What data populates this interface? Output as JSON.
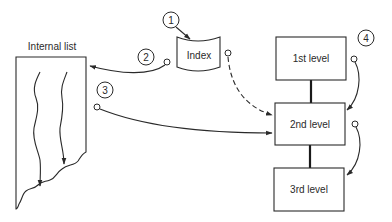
{
  "diagram": {
    "internal_list": {
      "label": "Internal list"
    },
    "index": {
      "label": "Index"
    },
    "levels": [
      {
        "label": "1st level"
      },
      {
        "label": "2nd level"
      },
      {
        "label": "3rd level"
      }
    ],
    "steps": [
      {
        "number": "1"
      },
      {
        "number": "2"
      },
      {
        "number": "3"
      },
      {
        "number": "4"
      }
    ],
    "colors": {
      "line": "#2a2a2a",
      "background": "#ffffff"
    }
  }
}
